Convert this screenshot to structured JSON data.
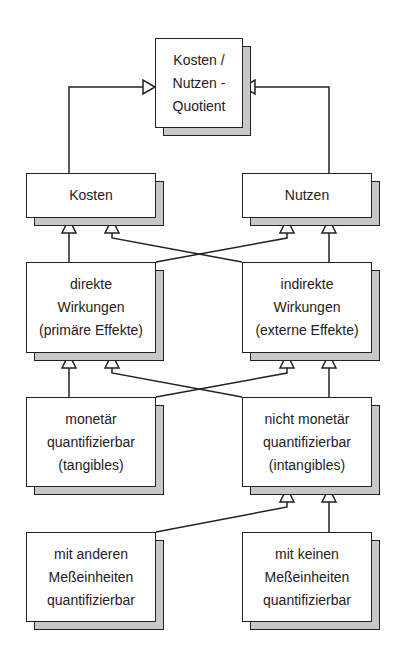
{
  "diagram": {
    "type": "hierarchy-flow",
    "nodes": [
      {
        "id": "quotient",
        "lines": [
          "Kosten /",
          "Nutzen -",
          "Quotient"
        ]
      },
      {
        "id": "kosten",
        "lines": [
          "Kosten"
        ]
      },
      {
        "id": "nutzen",
        "lines": [
          "Nutzen"
        ]
      },
      {
        "id": "direkte",
        "lines": [
          "direkte",
          "Wirkungen",
          "(primäre Effekte)"
        ]
      },
      {
        "id": "indirekte",
        "lines": [
          "indirekte",
          "Wirkungen",
          "(externe Effekte)"
        ]
      },
      {
        "id": "monetaer",
        "lines": [
          "monetär",
          "quantifizierbar",
          "(tangibles)"
        ]
      },
      {
        "id": "nicht_monetaer",
        "lines": [
          "nicht monetär",
          "quantifizierbar",
          "(intangibles)"
        ]
      },
      {
        "id": "andere_mess",
        "lines": [
          "mit anderen",
          "Meßeinheiten",
          "quantifizierbar"
        ]
      },
      {
        "id": "keine_mess",
        "lines": [
          "mit keinen",
          "Meßeinheiten",
          "quantifizierbar"
        ]
      }
    ],
    "edges": [
      {
        "from": "kosten",
        "to": "quotient"
      },
      {
        "from": "nutzen",
        "to": "quotient"
      },
      {
        "from": "direkte",
        "to": "kosten"
      },
      {
        "from": "direkte",
        "to": "nutzen"
      },
      {
        "from": "indirekte",
        "to": "kosten"
      },
      {
        "from": "indirekte",
        "to": "nutzen"
      },
      {
        "from": "monetaer",
        "to": "direkte"
      },
      {
        "from": "monetaer",
        "to": "indirekte"
      },
      {
        "from": "nicht_monetaer",
        "to": "direkte"
      },
      {
        "from": "nicht_monetaer",
        "to": "indirekte"
      },
      {
        "from": "andere_mess",
        "to": "nicht_monetaer"
      },
      {
        "from": "keine_mess",
        "to": "nicht_monetaer"
      }
    ],
    "colors": {
      "line": "#222222",
      "shadow": "#c8c8c8",
      "fill": "#ffffff"
    }
  }
}
